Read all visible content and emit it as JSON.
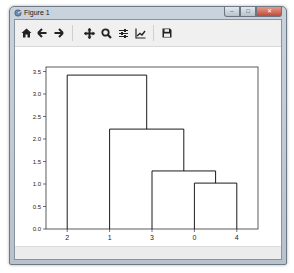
{
  "window": {
    "title": "Figure 1",
    "controls": {
      "minimize": "–",
      "maximize": "□",
      "close": "✕"
    }
  },
  "toolbar": {
    "buttons": [
      {
        "name": "home",
        "icon": "home-icon",
        "tooltip": "Reset original view"
      },
      {
        "name": "back",
        "icon": "arrow-left-icon",
        "tooltip": "Back to previous view"
      },
      {
        "name": "forward",
        "icon": "arrow-right-icon",
        "tooltip": "Forward to next view"
      },
      {
        "name": "pan",
        "icon": "move-icon",
        "tooltip": "Pan axes"
      },
      {
        "name": "zoom",
        "icon": "magnifier-icon",
        "tooltip": "Zoom to rectangle"
      },
      {
        "name": "subplots",
        "icon": "sliders-icon",
        "tooltip": "Configure subplots"
      },
      {
        "name": "edit",
        "icon": "line-chart-icon",
        "tooltip": "Edit axis, curve and image parameters"
      },
      {
        "name": "save",
        "icon": "floppy-disk-icon",
        "tooltip": "Save the figure"
      }
    ]
  },
  "statusbar": {
    "text": ""
  },
  "chart_data": {
    "type": "dendrogram",
    "title": "",
    "xlabel": "",
    "ylabel": "",
    "leaf_order": [
      "2",
      "1",
      "3",
      "0",
      "4"
    ],
    "ylim": [
      0,
      3.6
    ],
    "yticks": [
      "0.0",
      "0.5",
      "1.0",
      "1.5",
      "2.0",
      "2.5",
      "3.0",
      "3.5"
    ],
    "ytick_values": [
      0.0,
      0.5,
      1.0,
      1.5,
      2.0,
      2.5,
      3.0,
      3.5
    ],
    "grid": false,
    "links": [
      {
        "children": [
          "0",
          "4"
        ],
        "height": 1.02
      },
      {
        "children": [
          "3",
          "(0,4)"
        ],
        "height": 1.29
      },
      {
        "children": [
          "1",
          "(3,(0,4))"
        ],
        "height": 2.22
      },
      {
        "children": [
          "2",
          "(1,(3,(0,4)))"
        ],
        "height": 3.42
      }
    ],
    "line_color": "#000000"
  }
}
